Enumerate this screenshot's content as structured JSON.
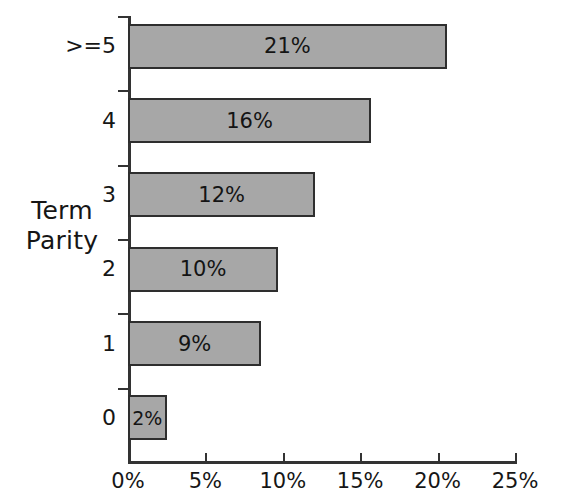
{
  "chart_data": {
    "type": "bar",
    "orientation": "horizontal",
    "title": "",
    "subtitle": "",
    "xlabel": "",
    "ylabel": "Term\nParity",
    "categories": [
      ">=5",
      "4",
      "3",
      "2",
      "1",
      "0"
    ],
    "values": [
      20.6,
      15.7,
      12.1,
      9.7,
      8.6,
      2.5
    ],
    "data_labels": [
      "21%",
      "16%",
      "12%",
      "10%",
      "9%",
      "2%"
    ],
    "xlim": [
      0,
      25
    ],
    "ylim": [
      0,
      6
    ],
    "xticks": [
      0,
      5,
      10,
      15,
      20,
      25
    ],
    "xtick_labels": [
      "0%",
      "5%",
      "10%",
      "15%",
      "20%",
      "25%"
    ],
    "grid": false,
    "legend": false,
    "legend_position": "none",
    "bar_color": "#a7a7a7",
    "bar_border_color": "#2e2e2e",
    "axis_color": "#333333",
    "text_color": "#161616",
    "background_color": "#ffffff",
    "series": [
      {
        "name": "Share of terms",
        "values": [
          20.6,
          15.7,
          12.1,
          9.7,
          8.6,
          2.5
        ]
      }
    ],
    "points": [
      {
        "category": ">=5",
        "value": 20.6,
        "label": "21%"
      },
      {
        "category": "4",
        "value": 15.7,
        "label": "16%"
      },
      {
        "category": "3",
        "value": 12.1,
        "label": "12%"
      },
      {
        "category": "2",
        "value": 9.7,
        "label": "10%"
      },
      {
        "category": "1",
        "value": 8.6,
        "label": "9%"
      },
      {
        "category": "0",
        "value": 2.5,
        "label": "2%"
      }
    ]
  },
  "axis": {
    "y_title_line1": "Term",
    "y_title_line2": "Parity",
    "y_title": "Term\nParity"
  }
}
